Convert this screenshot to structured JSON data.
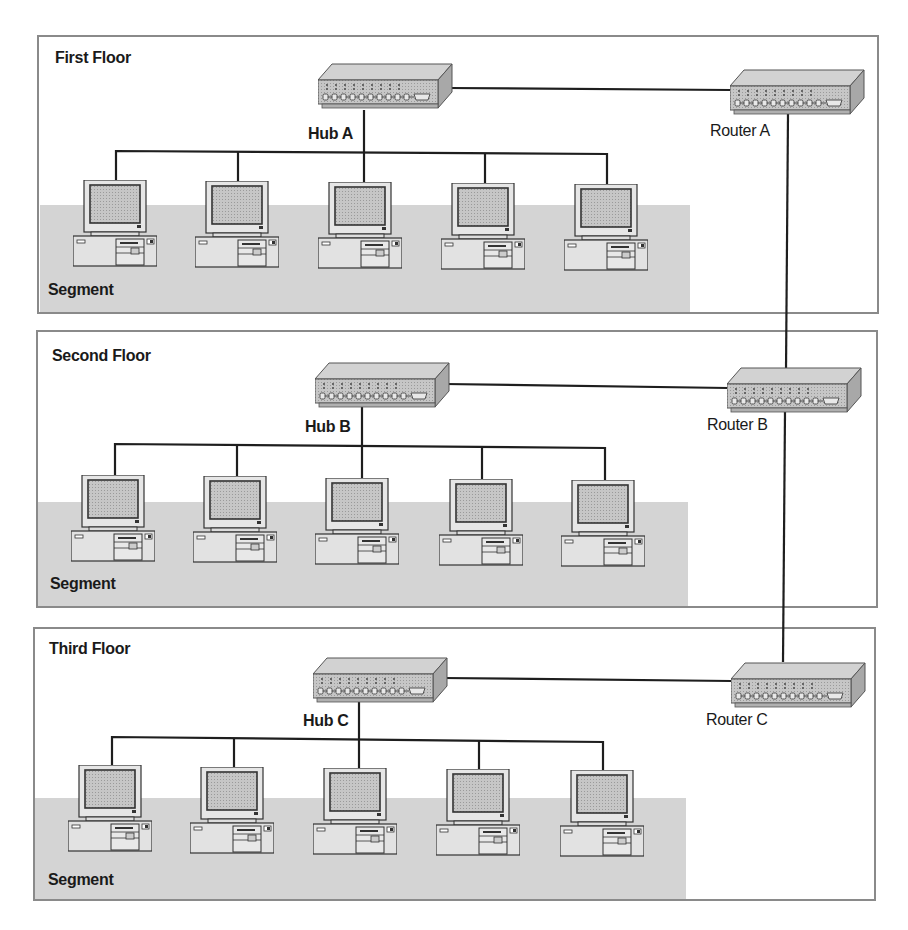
{
  "diagram": {
    "type": "network-topology",
    "floors": [
      {
        "title": "First Floor",
        "segment_label": "Segment",
        "hub": {
          "label": "Hub A"
        },
        "router": {
          "label": "Router A"
        },
        "computers": 5
      },
      {
        "title": "Second Floor",
        "segment_label": "Segment",
        "hub": {
          "label": "Hub B"
        },
        "router": {
          "label": "Router B"
        },
        "computers": 5
      },
      {
        "title": "Third Floor",
        "segment_label": "Segment",
        "hub": {
          "label": "Hub C"
        },
        "router": {
          "label": "Router C"
        },
        "computers": 5
      }
    ],
    "connections": [
      {
        "from": "Hub A",
        "to": "Router A"
      },
      {
        "from": "Hub B",
        "to": "Router B"
      },
      {
        "from": "Hub C",
        "to": "Router C"
      },
      {
        "from": "Router A",
        "to": "Router B"
      },
      {
        "from": "Router B",
        "to": "Router C"
      }
    ],
    "colors": {
      "segment_fill": "#d4d4d4",
      "frame_border": "#8a8a8a",
      "wire": "#1e1e1e",
      "device_fill": "#c8c8c8"
    }
  }
}
